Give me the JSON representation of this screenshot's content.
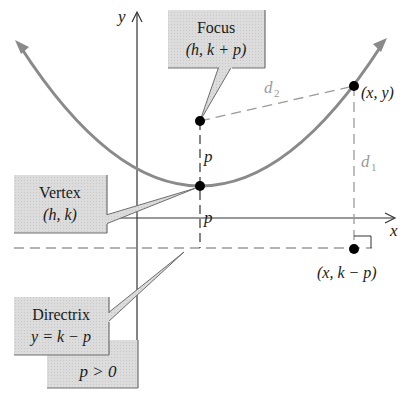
{
  "figure": {
    "axes": {
      "x_label": "x",
      "y_label": "y"
    },
    "focus": {
      "title": "Focus",
      "coords": "(h, k + p)"
    },
    "vertex": {
      "title": "Vertex",
      "coords": "(h, k)"
    },
    "directrix": {
      "title": "Directrix",
      "equation": "y = k − p"
    },
    "condition": "p > 0",
    "point_on_parabola": "(x, y)",
    "point_on_directrix": "(x, k − p)",
    "distances": {
      "d1": "d",
      "d1_sub": "1",
      "d2": "d",
      "d2_sub": "2",
      "p_upper": "p",
      "p_lower": "p"
    },
    "colors": {
      "curve": "#8a8a8a",
      "callout_fill": "#d9d9d9",
      "callout_border": "#6e6e6e",
      "dashed": "#9a9a9a",
      "axis": "#333333",
      "point": "#000000"
    }
  }
}
